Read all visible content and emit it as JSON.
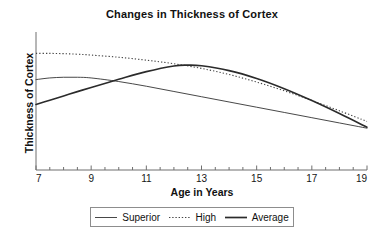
{
  "chart_data": {
    "type": "line",
    "title": "Changes in Thickness of Cortex",
    "xlabel": "Age in Years",
    "ylabel": "Thickness of Cortex",
    "xlim": [
      7,
      19
    ],
    "ylim": [
      0,
      1
    ],
    "xticks": [
      7,
      9,
      11,
      13,
      15,
      17,
      19
    ],
    "xtick_labels": [
      "7",
      "9",
      "11",
      "13",
      "15",
      "17",
      "19"
    ],
    "minor_tick_step": 0.5,
    "yticks": [],
    "ytick_labels": [],
    "grid": false,
    "legend_position": "bottom",
    "series": [
      {
        "name": "Superior",
        "style": "solid-thin",
        "color": "#333333",
        "x": [
          7,
          7.5,
          8,
          8.5,
          9,
          10,
          11,
          12,
          13,
          14,
          15,
          16,
          17,
          18,
          19
        ],
        "y": [
          0.655,
          0.667,
          0.672,
          0.672,
          0.667,
          0.641,
          0.607,
          0.569,
          0.531,
          0.493,
          0.455,
          0.417,
          0.379,
          0.341,
          0.303
        ]
      },
      {
        "name": "High",
        "style": "dotted",
        "color": "#444444",
        "x": [
          7,
          7.5,
          8,
          8.5,
          9,
          10,
          11,
          12,
          13,
          14,
          15,
          16,
          17,
          18,
          19
        ],
        "y": [
          0.845,
          0.845,
          0.843,
          0.839,
          0.833,
          0.817,
          0.796,
          0.77,
          0.736,
          0.692,
          0.637,
          0.574,
          0.504,
          0.429,
          0.352
        ]
      },
      {
        "name": "Average",
        "style": "solid-thick",
        "color": "#2b2b2b",
        "x": [
          7,
          7.5,
          8,
          8.5,
          9,
          10,
          11,
          12,
          12.5,
          13,
          14,
          15,
          16,
          17,
          18,
          19
        ],
        "y": [
          0.475,
          0.506,
          0.537,
          0.568,
          0.598,
          0.657,
          0.713,
          0.754,
          0.76,
          0.755,
          0.72,
          0.663,
          0.589,
          0.503,
          0.409,
          0.31
        ]
      }
    ]
  },
  "legend": {
    "entries": [
      {
        "label": "Superior",
        "icon": "solid-line-icon"
      },
      {
        "label": "High",
        "icon": "dotted-line-icon"
      },
      {
        "label": "Average",
        "icon": "thick-line-icon"
      }
    ]
  }
}
